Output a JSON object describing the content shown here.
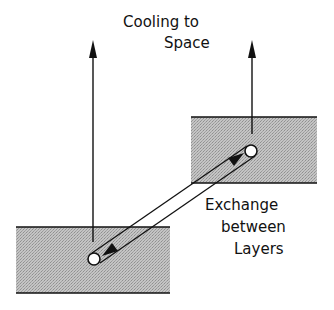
{
  "diagram": {
    "labels": {
      "cooling_line1": "Cooling to",
      "cooling_line2": "Space",
      "exchange_line1": "Exchange",
      "exchange_line2": "between",
      "exchange_line3": "Layers"
    },
    "colors": {
      "layer_fill": "#bdbdbd",
      "stroke": "#111111",
      "background": "#ffffff"
    },
    "elements": [
      {
        "id": "upper-layer",
        "kind": "shaded-layer"
      },
      {
        "id": "lower-layer",
        "kind": "shaded-layer"
      },
      {
        "id": "upper-point",
        "kind": "circle"
      },
      {
        "id": "lower-point",
        "kind": "circle"
      },
      {
        "id": "cooling-arrow-left",
        "kind": "arrow",
        "direction": "up"
      },
      {
        "id": "cooling-arrow-right",
        "kind": "arrow",
        "direction": "up"
      },
      {
        "id": "exchange-arrow",
        "kind": "double-headed-band"
      }
    ]
  }
}
